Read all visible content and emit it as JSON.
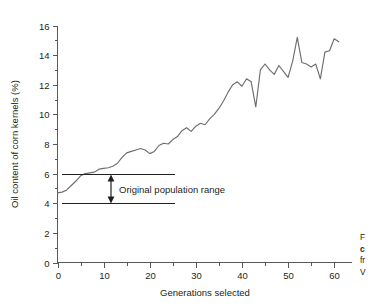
{
  "figure": {
    "caption_lines": [
      {
        "text": "F",
        "bold": false
      },
      {
        "text": "c",
        "bold": true
      },
      {
        "text": "fr",
        "bold": false
      },
      {
        "text": "V",
        "bold": false
      }
    ]
  },
  "annotation": {
    "label": "Original population range",
    "upper_value": 6,
    "lower_value": 4
  },
  "chart_data": {
    "type": "line",
    "title": "",
    "xlabel": "Generations selected",
    "ylabel": "Oil content of corn kernels (%)",
    "xlim": [
      0,
      63
    ],
    "ylim": [
      0,
      16
    ],
    "grid": false,
    "legend": null,
    "x_ticks_major": [
      0,
      10,
      20,
      30,
      40,
      50,
      60
    ],
    "x_ticks_minor": [
      5,
      15,
      25,
      35,
      45,
      55
    ],
    "y_ticks_major": [
      0,
      2,
      4,
      6,
      8,
      10,
      12,
      14,
      16
    ],
    "y_ticks_minor": [
      1,
      3,
      5,
      7,
      9,
      11,
      13,
      15
    ],
    "series": [
      {
        "name": "Oil content of corn kernels",
        "color": "#6d6e71",
        "x": [
          0,
          1,
          2,
          3,
          4,
          5,
          6,
          7,
          8,
          9,
          10,
          11,
          12,
          13,
          14,
          15,
          16,
          17,
          18,
          19,
          20,
          21,
          22,
          23,
          24,
          25,
          26,
          27,
          28,
          29,
          30,
          31,
          32,
          33,
          34,
          35,
          36,
          37,
          38,
          39,
          40,
          41,
          42,
          43,
          44,
          45,
          46,
          47,
          48,
          49,
          50,
          51,
          52,
          53,
          54,
          55,
          56,
          57,
          58,
          59,
          60,
          61
        ],
        "values": [
          4.7,
          4.75,
          4.9,
          5.2,
          5.5,
          5.85,
          6.0,
          6.05,
          6.1,
          6.3,
          6.35,
          6.4,
          6.5,
          6.7,
          7.1,
          7.4,
          7.5,
          7.6,
          7.7,
          7.6,
          7.35,
          7.5,
          7.9,
          8.05,
          8.0,
          8.3,
          8.5,
          8.9,
          9.1,
          8.85,
          9.2,
          9.4,
          9.3,
          9.7,
          10.0,
          10.4,
          10.9,
          11.5,
          12.0,
          12.2,
          11.9,
          12.4,
          12.2,
          10.5,
          13.0,
          13.4,
          13.0,
          12.7,
          13.3,
          12.9,
          12.5,
          13.6,
          15.2,
          13.5,
          13.4,
          13.2,
          13.4,
          12.4,
          14.2,
          14.3,
          15.1,
          14.9
        ]
      }
    ]
  }
}
